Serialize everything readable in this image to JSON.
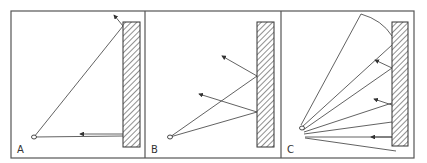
{
  "figure": {
    "colors": {
      "line": "#3a3a3a",
      "frame": "#555555",
      "background": "#ffffff"
    },
    "panels": [
      {
        "label": "A",
        "eye": [
          34,
          137
        ],
        "wall": {
          "x": 123,
          "y": 22,
          "w": 17,
          "h": 125
        },
        "rays": [
          {
            "from": [
              34,
              137
            ],
            "to": [
              123,
              26
            ]
          },
          {
            "from": [
              34,
              137
            ],
            "to": [
              123,
              136
            ]
          }
        ],
        "reflections": [
          {
            "from": [
              123,
              26
            ],
            "to": [
              114,
              15
            ]
          },
          {
            "from": [
              123,
              134
            ],
            "to": [
              80,
              134
            ]
          }
        ]
      },
      {
        "label": "B",
        "eye": [
          170,
          137
        ],
        "wall": {
          "x": 257,
          "y": 22,
          "w": 17,
          "h": 125
        },
        "rays": [
          {
            "from": [
              170,
              137
            ],
            "to": [
              257,
              76
            ]
          },
          {
            "from": [
              170,
              137
            ],
            "to": [
              257,
              112
            ]
          }
        ],
        "reflections": [
          {
            "from": [
              257,
              76
            ],
            "to": [
              222,
              56
            ]
          },
          {
            "from": [
              257,
              112
            ],
            "to": [
              199,
              94
            ]
          }
        ]
      },
      {
        "label": "C",
        "eye": [
          302,
          128
        ],
        "wall": {
          "x": 392,
          "y": 22,
          "w": 16,
          "h": 124
        },
        "rays": [
          {
            "from": [
              301,
              125
            ],
            "to": [
              361,
              14
            ]
          },
          {
            "from": [
              302,
              127
            ],
            "to": [
              392,
              45
            ]
          },
          {
            "from": [
              303,
              130
            ],
            "to": [
              392,
              68
            ]
          },
          {
            "from": [
              304,
              132
            ],
            "to": [
              392,
              103
            ]
          },
          {
            "from": [
              304,
              134
            ],
            "to": [
              392,
              122
            ]
          },
          {
            "from": [
              305,
              137
            ],
            "to": [
              392,
              137
            ]
          },
          {
            "from": [
              305,
              138
            ],
            "to": [
              396,
              151
            ]
          }
        ],
        "arc": {
          "from": [
            361,
            14
          ],
          "to": [
            392,
            36
          ]
        },
        "reflections": [
          {
            "from": [
              392,
              68
            ],
            "to": [
              375,
              60
            ]
          },
          {
            "from": [
              392,
              105
            ],
            "to": [
              374,
              99
            ]
          },
          {
            "from": [
              392,
              137
            ],
            "to": [
              371,
              137
            ]
          }
        ]
      }
    ]
  }
}
